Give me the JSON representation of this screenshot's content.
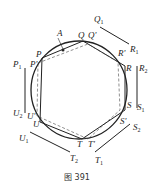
{
  "caption": "图 391",
  "labels": {
    "A": "A",
    "P": "P",
    "P_prime": "P'",
    "P1": "P",
    "Q": "Q",
    "Q_prime": "Q'",
    "Q1": "Q",
    "R": "R",
    "R_prime": "R'",
    "R1": "R",
    "R2": "R",
    "S": "S",
    "S_prime": "S'",
    "S1": "S",
    "S2": "S",
    "T": "T",
    "T_prime": "T'",
    "T1": "T",
    "T2": "T",
    "U": "U",
    "U_prime": "U'",
    "U1": "U",
    "U2": "U",
    "sub1": "1",
    "sub2": "2"
  }
}
